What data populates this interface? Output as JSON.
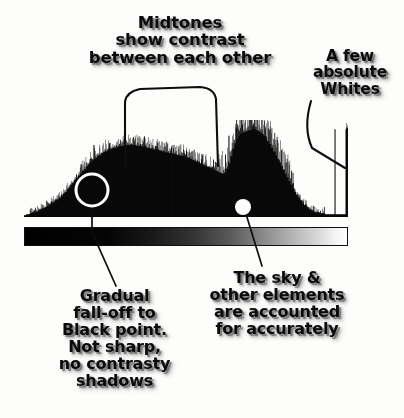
{
  "image": {
    "kind": "annotated-histogram-diagram",
    "background_color": "#fdfdfc",
    "ink_color": "#0b0b0b"
  },
  "callouts": [
    {
      "id": "midtones",
      "name": "callout-midtones",
      "text": "Midtones\nshow contrast\nbetween each other",
      "lines": [
        "Midtones",
        "show contrast",
        "between each other"
      ]
    },
    {
      "id": "whites",
      "name": "callout-absolute-whites",
      "text": "A few\nabsolute\nWhites",
      "lines": [
        "A few",
        "absolute",
        "Whites"
      ]
    },
    {
      "id": "blackpoint",
      "name": "callout-black-point",
      "text": "Gradual\nfall-off to\nBlack point.\nNot sharp,\nno contrasty\nshadows",
      "lines": [
        "Gradual",
        "fall-off to",
        "Black point.",
        "Not sharp,",
        "no contrasty",
        "shadows"
      ]
    },
    {
      "id": "sky",
      "name": "callout-sky-elements",
      "text": "The sky &\nother elements\nare accounted\nfor accurately",
      "lines": [
        "The sky &",
        "other elements",
        "are accounted",
        "for accurately"
      ]
    }
  ],
  "markers": {
    "shadow_circle": {
      "cx": 92,
      "cy": 190,
      "r": 16,
      "stroke": "#ffffff",
      "stroke_width": 3
    },
    "sky_dot": {
      "cx": 243,
      "cy": 207,
      "r": 8,
      "fill": "#ffffff"
    }
  },
  "leader_lines": {
    "midtones_bracket": "M125,166 L125,102 Q126,92 140,89 L200,87 Q214,88 216,99 L218,166",
    "whites_curve": "M311,101 Q303,128 312,148 L345,168",
    "blackpoint_line": "M92,206 L92,232 L116,286",
    "sky_line": "M246,214 L262,266"
  },
  "ramp": {
    "name": "tonal-gradient-ramp",
    "from": "#000000",
    "to": "#ffffff",
    "border_color": "#101010"
  },
  "chart_data": {
    "type": "area",
    "title": "",
    "subtitle": "",
    "xlabel": "",
    "ylabel": "",
    "legend": [],
    "grid": false,
    "xlim": [
      0,
      255
    ],
    "ylim": [
      0,
      100
    ],
    "x_axis_meaning": "tonal value: black point (0) to white point (255)",
    "y_axis_meaning": "relative pixel count",
    "bins": 162,
    "values": [
      2,
      3,
      3,
      4,
      5,
      5,
      6,
      7,
      8,
      9,
      10,
      11,
      12,
      13,
      15,
      16,
      18,
      19,
      21,
      23,
      25,
      27,
      30,
      32,
      35,
      37,
      40,
      42,
      45,
      47,
      50,
      52,
      55,
      57,
      59,
      61,
      63,
      64,
      66,
      67,
      69,
      70,
      71,
      72,
      73,
      74,
      75,
      75,
      76,
      76,
      77,
      77,
      77,
      78,
      78,
      78,
      78,
      78,
      77,
      77,
      77,
      76,
      76,
      75,
      75,
      74,
      74,
      73,
      73,
      72,
      72,
      71,
      71,
      70,
      70,
      69,
      69,
      68,
      68,
      67,
      67,
      66,
      66,
      65,
      64,
      64,
      63,
      62,
      61,
      60,
      59,
      58,
      57,
      56,
      55,
      54,
      53,
      52,
      51,
      50,
      49,
      48,
      47,
      47,
      48,
      52,
      58,
      66,
      74,
      80,
      85,
      88,
      90,
      91,
      92,
      93,
      94,
      94,
      95,
      95,
      94,
      93,
      92,
      90,
      88,
      85,
      82,
      79,
      75,
      71,
      67,
      63,
      59,
      55,
      51,
      47,
      43,
      39,
      35,
      31,
      27,
      24,
      21,
      18,
      15,
      13,
      11,
      9,
      8,
      7,
      6,
      5,
      5,
      4,
      4,
      4,
      3,
      3,
      3,
      3,
      3,
      3,
      3,
      3,
      3,
      3,
      3,
      95
    ],
    "spike_peaks": [
      {
        "bin": 36,
        "value": 78
      },
      {
        "bin": 44,
        "value": 80
      },
      {
        "bin": 52,
        "value": 82
      },
      {
        "bin": 60,
        "value": 79
      },
      {
        "bin": 68,
        "value": 77
      },
      {
        "bin": 76,
        "value": 74
      },
      {
        "bin": 84,
        "value": 72
      },
      {
        "bin": 92,
        "value": 68
      },
      {
        "bin": 106,
        "value": 88
      },
      {
        "bin": 110,
        "value": 96
      },
      {
        "bin": 113,
        "value": 100
      },
      {
        "bin": 116,
        "value": 92
      },
      {
        "bin": 119,
        "value": 98
      },
      {
        "bin": 122,
        "value": 86
      },
      {
        "bin": 126,
        "value": 80
      },
      {
        "bin": 130,
        "value": 70
      },
      {
        "bin": 161,
        "value": 95
      }
    ]
  }
}
